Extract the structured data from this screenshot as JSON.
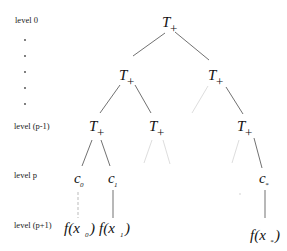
{
  "diagram": {
    "type": "tree",
    "level_labels": [
      {
        "id": "level-0",
        "text": "level 0",
        "x": 15,
        "y": 23
      },
      {
        "id": "level-p-minus-1",
        "text": "level (p-1)",
        "x": 14,
        "y": 129
      },
      {
        "id": "level-p",
        "text": "level p",
        "x": 14,
        "y": 178
      },
      {
        "id": "level-p-plus-1",
        "text": "level (p+1)",
        "x": 14,
        "y": 228
      }
    ],
    "ellipsis_dots_y": [
      40,
      56,
      72,
      88,
      104
    ],
    "nodes": {
      "root": {
        "label": "T",
        "sub": "+"
      },
      "l1_left": {
        "label": "T",
        "sub": "+"
      },
      "l1_right": {
        "label": "T",
        "sub": "+"
      },
      "lp1_a": {
        "label": "T",
        "sub": "+"
      },
      "lp1_b": {
        "label": "T",
        "sub": "+"
      },
      "lp1_c": {
        "label": "T",
        "sub": "+"
      },
      "c0": {
        "label": "c",
        "sub": "0"
      },
      "c1": {
        "label": "c",
        "sub": "1"
      },
      "cstar": {
        "label": "c",
        "sub": "*"
      },
      "f0": {
        "text": "f(x",
        "sub": "0",
        "close": ")"
      },
      "f1": {
        "text": "f(x",
        "sub": "1",
        "close": ")"
      },
      "fstar": {
        "text": "f(x",
        "sub": "*",
        "close": ")"
      }
    },
    "edge_color": "#333333",
    "faint_edge_color": "#d0d0d0"
  }
}
